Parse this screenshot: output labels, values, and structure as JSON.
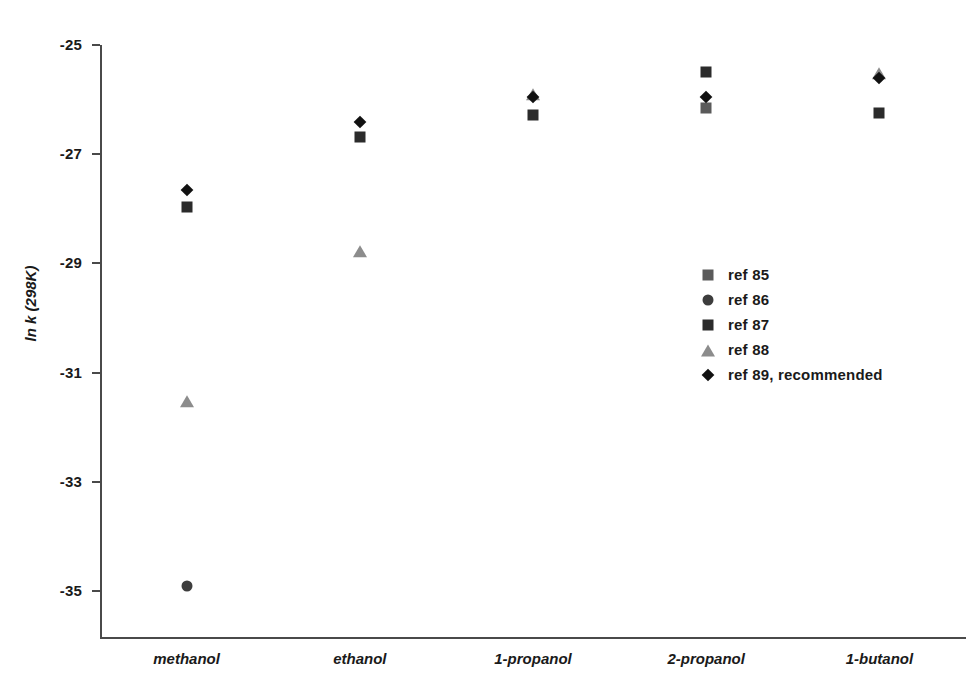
{
  "chart_data": {
    "type": "scatter",
    "title": "",
    "xlabel": "",
    "ylabel": "ln k (298K)",
    "categories": [
      "methanol",
      "ethanol",
      "1-propanol",
      "2-propanol",
      "1-butanol"
    ],
    "ylim": [
      -36,
      -25
    ],
    "yticks": [
      -25,
      -27,
      -29,
      -31,
      -33,
      -35
    ],
    "ytick_labels": [
      "-25",
      "-27",
      "-29",
      "-31",
      "-33",
      "-35"
    ],
    "grid": false,
    "legend_position": "center-right",
    "series": [
      {
        "name": "ref 85",
        "marker": "square",
        "color": "#5a5a5a",
        "values": [
          null,
          null,
          null,
          -26.15,
          null
        ]
      },
      {
        "name": "ref 86",
        "marker": "dot",
        "color": "#3d3d3d",
        "values": [
          -34.9,
          null,
          null,
          null,
          null
        ]
      },
      {
        "name": "ref 87",
        "marker": "square",
        "color": "#2b2b2b",
        "values": [
          -27.97,
          -26.69,
          -26.28,
          -25.5,
          -26.25
        ]
      },
      {
        "name": "ref 88",
        "marker": "triangle",
        "color": "#8c8c8c",
        "values": [
          -31.5,
          -28.76,
          -25.88,
          null,
          -25.5
        ]
      },
      {
        "name": "ref 89, recommended",
        "marker": "diamond",
        "color": "#111111",
        "values": [
          -27.66,
          -26.41,
          -25.95,
          -25.95,
          -25.6
        ]
      }
    ]
  },
  "legend": {
    "items": [
      {
        "label": "ref 85"
      },
      {
        "label": "ref 86"
      },
      {
        "label": "ref 87"
      },
      {
        "label": "ref 88"
      },
      {
        "label": "ref 89, recommended"
      }
    ]
  }
}
